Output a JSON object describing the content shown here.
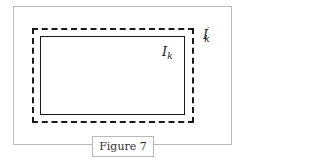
{
  "figure": {
    "caption": "Figure 7",
    "inner_rect_label": {
      "base": "I",
      "sub": "k",
      "prime": ""
    },
    "outer_rect_label": {
      "base": "I",
      "sub": "k",
      "prime": "′"
    }
  },
  "colors": {
    "frame": "#b8b8b8",
    "lines": "#1a1a1a",
    "background": "#ffffff"
  }
}
